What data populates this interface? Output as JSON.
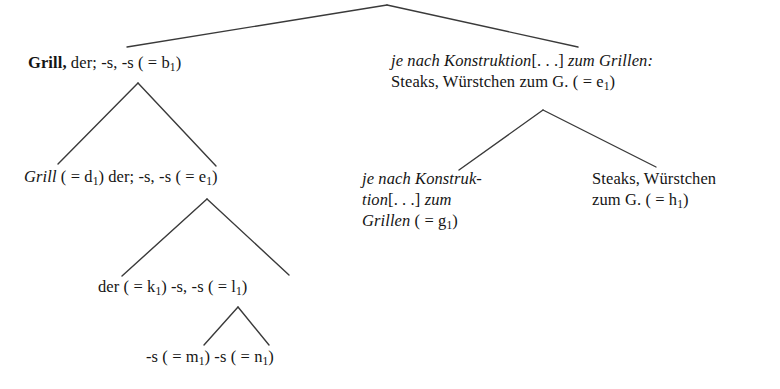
{
  "figure": {
    "type": "linguistic-constituency-tree",
    "language": "German",
    "background_color": "#ffffff",
    "text_color": "#151515",
    "edge_color": "#3a3a3a"
  },
  "nodes": {
    "root_left": {
      "id": "b1",
      "lines": [
        [
          {
            "text": "Grill,",
            "style": "bold"
          },
          {
            "text": " der; -s, -s ( = ",
            "style": "roman"
          },
          {
            "text": "b",
            "style": "roman"
          },
          {
            "text": "1",
            "style": "sub"
          },
          {
            "text": ")",
            "style": "roman"
          }
        ]
      ],
      "plain": "Grill, der; -s, -s ( = b1)"
    },
    "root_right": {
      "id": "e1",
      "lines": [
        [
          {
            "text": "je nach Konstruktion",
            "style": "italic"
          },
          {
            "text": "[. . .]",
            "style": "roman"
          },
          {
            "text": " zum Grillen:",
            "style": "italic"
          }
        ],
        [
          {
            "text": "Steaks, Würstchen zum G. ( = ",
            "style": "roman"
          },
          {
            "text": "e",
            "style": "roman"
          },
          {
            "text": "1",
            "style": "sub"
          },
          {
            "text": ")",
            "style": "roman"
          }
        ]
      ],
      "plain": "je nach Konstruktion [. . .] zum Grillen: Steaks, Würstchen zum G. ( = e1)"
    },
    "grill_d1": {
      "id": "e1",
      "lines": [
        [
          {
            "text": "Grill",
            "style": "italic"
          },
          {
            "text": " ( = d",
            "style": "roman"
          },
          {
            "text": "1",
            "style": "sub"
          },
          {
            "text": ") der; -s, -s ( = e",
            "style": "roman"
          },
          {
            "text": "1",
            "style": "sub"
          },
          {
            "text": ")",
            "style": "roman"
          }
        ]
      ],
      "plain": "Grill ( = d1) der; -s, -s ( = e1)"
    },
    "je_g1": {
      "id": "g1",
      "lines": [
        [
          {
            "text": "je nach Konstruk-",
            "style": "italic"
          }
        ],
        [
          {
            "text": "tion",
            "style": "italic"
          },
          {
            "text": "[. . .]",
            "style": "roman"
          },
          {
            "text": " zum",
            "style": "italic"
          }
        ],
        [
          {
            "text": "Grillen",
            "style": "italic"
          },
          {
            "text": " ( = g",
            "style": "roman"
          },
          {
            "text": "1",
            "style": "sub"
          },
          {
            "text": ")",
            "style": "roman"
          }
        ]
      ],
      "plain": "je nach Konstruktion [. . .] zum Grillen ( = g1)"
    },
    "steaks_h1": {
      "id": "h1",
      "lines": [
        [
          {
            "text": "Steaks, Würstchen",
            "style": "roman"
          }
        ],
        [
          {
            "text": "zum G. ( = h",
            "style": "roman"
          },
          {
            "text": "1",
            "style": "sub"
          },
          {
            "text": ")",
            "style": "roman"
          }
        ]
      ],
      "plain": "Steaks, Würstchen zum G. ( = h1)"
    },
    "der_k1": {
      "id": "l1",
      "lines": [
        [
          {
            "text": "der ( = k",
            "style": "roman"
          },
          {
            "text": "1",
            "style": "sub"
          },
          {
            "text": ") -s, -s ( = l",
            "style": "roman"
          },
          {
            "text": "1",
            "style": "sub"
          },
          {
            "text": ")",
            "style": "roman"
          }
        ]
      ],
      "plain": "der ( = k1) -s, -s ( = l1)"
    },
    "s_m1": {
      "id": "n1",
      "lines": [
        [
          {
            "text": "-s ( = m",
            "style": "roman"
          },
          {
            "text": "1",
            "style": "sub"
          },
          {
            "text": ") -s ( = n",
            "style": "roman"
          },
          {
            "text": "1",
            "style": "sub"
          },
          {
            "text": ")",
            "style": "roman"
          }
        ]
      ],
      "plain": "-s ( = m1) -s ( = n1)"
    }
  },
  "edges": [
    {
      "name": "root-to-left",
      "from": [
        387,
        5
      ],
      "to": [
        127,
        47
      ]
    },
    {
      "name": "root-to-right",
      "from": [
        387,
        5
      ],
      "to": [
        578,
        47
      ]
    },
    {
      "name": "b1-to-d1e1",
      "from": [
        138,
        83
      ],
      "to": [
        58,
        164
      ]
    },
    {
      "name": "b1-to-right-stub",
      "from": [
        138,
        83
      ],
      "to": [
        216,
        166
      ]
    },
    {
      "name": "e1-to-g1",
      "from": [
        543,
        110
      ],
      "to": [
        459,
        170
      ]
    },
    {
      "name": "e1-to-h1",
      "from": [
        543,
        110
      ],
      "to": [
        656,
        167
      ]
    },
    {
      "name": "d1e1-to-k1l1",
      "from": [
        207,
        199
      ],
      "to": [
        122,
        276
      ]
    },
    {
      "name": "d1e1-to-right-stub",
      "from": [
        207,
        199
      ],
      "to": [
        289,
        275
      ]
    },
    {
      "name": "k1l1-to-m1",
      "from": [
        238,
        307
      ],
      "to": [
        204,
        345
      ]
    },
    {
      "name": "k1l1-to-n1",
      "from": [
        238,
        307
      ],
      "to": [
        269,
        345
      ]
    }
  ],
  "caption": {
    "text": ""
  }
}
